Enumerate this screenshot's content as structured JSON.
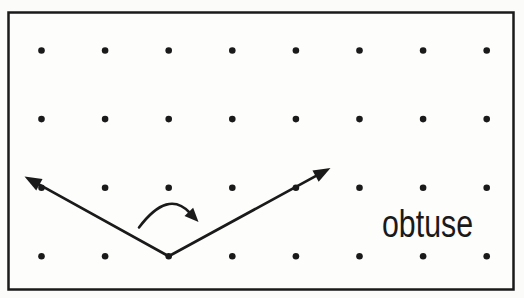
{
  "scene": {
    "label": {
      "text": "obtuse",
      "x": 382,
      "y": 237,
      "font_size": 38,
      "text_length": 91
    },
    "colors": {
      "ink": "#1a1a1a",
      "paper": "#fdfdfc"
    },
    "frame": {
      "x": 8.5,
      "y": 12.5,
      "width": 505,
      "height": 277,
      "stroke_width": 2.5
    },
    "grid": {
      "cols": 8,
      "rows": 4,
      "x0": 41.5,
      "y0": 50.5,
      "dx": 63.6,
      "dy": 68.6,
      "dot_radius": 3.3
    },
    "angle": {
      "type": "obtuse",
      "vertex": [
        168.7,
        256.3
      ],
      "rays": [
        {
          "name": "left",
          "through": [
            41.5,
            187.7
          ],
          "tip": [
            24.5,
            176.5
          ]
        },
        {
          "name": "right",
          "through": [
            295.9,
            187.7
          ],
          "tip": [
            330.5,
            168.0
          ]
        }
      ],
      "stroke_width": 2.7,
      "arrowhead": {
        "length": 17,
        "half_width": 6.5
      }
    },
    "rotation_arrow": {
      "direction": "clockwise",
      "path": "M 139 227.5 Q 168 189 190 213",
      "tip": [
        198.5,
        222.0
      ],
      "tangent": [
        22,
        23
      ],
      "stroke_width": 2.6,
      "arrowhead": {
        "length": 14,
        "half_width": 6
      }
    }
  }
}
